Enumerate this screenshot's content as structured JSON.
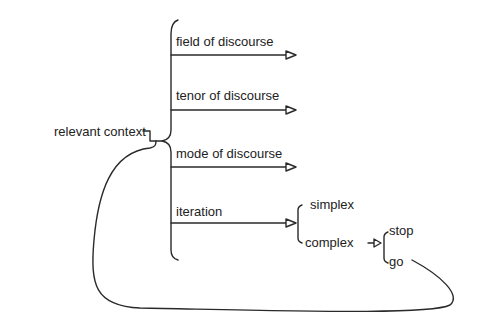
{
  "diagram": {
    "root": {
      "label": "relevant context"
    },
    "branches": [
      {
        "label": "field of discourse"
      },
      {
        "label": "tenor of discourse"
      },
      {
        "label": "mode of discourse"
      },
      {
        "label": "iteration"
      }
    ],
    "iteration_options": [
      {
        "label": "simplex"
      },
      {
        "label": "complex"
      }
    ],
    "complex_options": [
      {
        "label": "stop"
      },
      {
        "label": "go"
      }
    ],
    "colors": {
      "line": "#2a2a2a",
      "text": "#222222",
      "background": "#ffffff"
    }
  }
}
